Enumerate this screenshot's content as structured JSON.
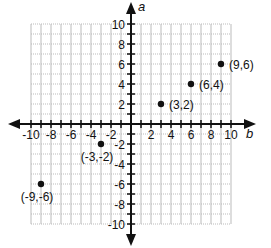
{
  "chart_data": {
    "type": "scatter",
    "title": "",
    "xlabel": "b",
    "ylabel": "a",
    "xlim": [
      -10,
      10
    ],
    "ylim": [
      -10,
      10
    ],
    "grid": true,
    "x_ticks": [
      -10,
      -9,
      -8,
      -7,
      -6,
      -5,
      -4,
      -3,
      -2,
      -1,
      1,
      2,
      3,
      4,
      5,
      6,
      7,
      8,
      9,
      10
    ],
    "x_tick_labels": [
      "-10",
      "-8",
      "-6",
      "-4",
      "-2",
      "2",
      "4",
      "6",
      "8",
      "10"
    ],
    "y_tick_labels": [
      "10",
      "8",
      "6",
      "4",
      "2",
      "-2",
      "-4",
      "-6",
      "-8",
      "-10"
    ],
    "points": [
      {
        "x": 3,
        "y": 2,
        "label": "(3,2)"
      },
      {
        "x": 6,
        "y": 4,
        "label": "(6,4)"
      },
      {
        "x": 9,
        "y": 6,
        "label": "(9,6)"
      },
      {
        "x": -3,
        "y": -2,
        "label": "(-3,-2)"
      },
      {
        "x": -9,
        "y": -6,
        "label": "(-9,-6)"
      }
    ]
  },
  "colors": {
    "axis": "#111111",
    "grid": "#bbbbbb",
    "point": "#111111"
  }
}
